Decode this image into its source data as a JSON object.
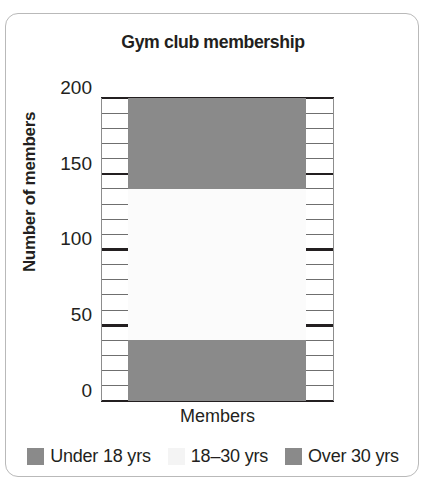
{
  "chart_data": {
    "type": "bar",
    "subtype": "stacked-single-bar",
    "title": "Gym club membership",
    "xlabel": "Members",
    "ylabel": "Number of members",
    "categories": [
      "Members"
    ],
    "ylim": [
      0,
      200
    ],
    "y_major_ticks": [
      0,
      50,
      100,
      150,
      200
    ],
    "y_tick_labels": [
      "0",
      "50",
      "100",
      "150",
      "200"
    ],
    "y_minor_tick_step": 10,
    "grid": true,
    "legend_position": "bottom",
    "series": [
      {
        "name": "Over 30 yrs",
        "values": [
          40
        ],
        "range": [
          0,
          40
        ],
        "color": "#8a8a8a",
        "swatch": "#8a8a8a"
      },
      {
        "name": "18–30 yrs",
        "values": [
          100
        ],
        "range": [
          40,
          140
        ],
        "color": "#fbfbfb",
        "swatch": "#f4f4f4"
      },
      {
        "name": "Under 18 yrs",
        "values": [
          60
        ],
        "range": [
          140,
          200
        ],
        "color": "#8a8a8a",
        "swatch": "#8a8a8a"
      }
    ],
    "legend": [
      {
        "label": "Under 18 yrs",
        "swatch": "#8a8a8a"
      },
      {
        "label": "18–30 yrs",
        "swatch": "#f4f4f4"
      },
      {
        "label": "Over 30 yrs",
        "swatch": "#8a8a8a"
      }
    ],
    "total": 200
  },
  "colors": {
    "gray_fill": "#8a8a8a",
    "white_fill": "#fbfbfb",
    "axis": "#231f20",
    "grid_minor": "#6f6f6f",
    "card_border": "#b9b9b9",
    "text": "#231f20"
  }
}
